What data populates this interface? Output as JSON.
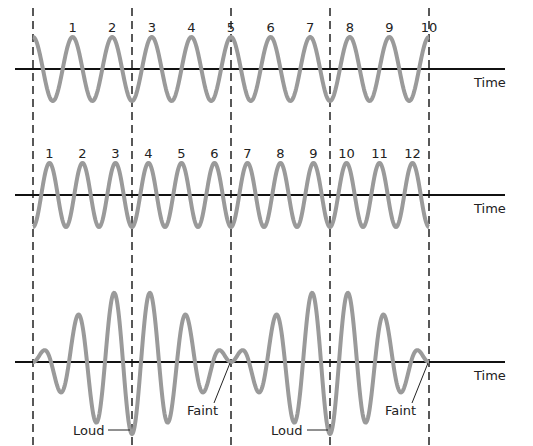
{
  "colors": {
    "wave": "#9a9a9a",
    "axis": "#111111",
    "dash": "#222222",
    "text": "#222222"
  },
  "dashed_lines_x": [
    33,
    132,
    231,
    330,
    429
  ],
  "wave1": {
    "axis_label": "Time",
    "cycle_labels": [
      "1",
      "2",
      "3",
      "4",
      "5",
      "6",
      "7",
      "8",
      "9",
      "10"
    ],
    "cycles": 10
  },
  "wave2": {
    "axis_label": "Time",
    "cycle_labels": [
      "1",
      "2",
      "3",
      "4",
      "5",
      "6",
      "7",
      "8",
      "9",
      "10",
      "11",
      "12"
    ],
    "cycles": 12
  },
  "beat": {
    "axis_label": "Time",
    "annotations": [
      {
        "text": "Loud",
        "at": "first beat maximum"
      },
      {
        "text": "Faint",
        "at": "first beat minimum"
      },
      {
        "text": "Loud",
        "at": "second beat maximum"
      },
      {
        "text": "Faint",
        "at": "second beat minimum"
      }
    ]
  }
}
